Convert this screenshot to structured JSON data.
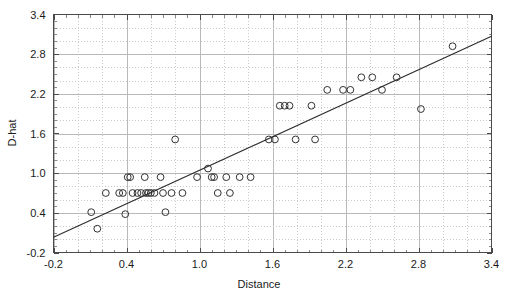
{
  "chart_data": {
    "type": "scatter",
    "title": "",
    "xlabel": "Distance",
    "ylabel": "D-hat",
    "xlim": [
      -0.2,
      3.4
    ],
    "ylim": [
      -0.2,
      3.4
    ],
    "xticks": [
      "-0.2",
      "0.4",
      "1.0",
      "1.6",
      "2.2",
      "2.8",
      "3.4"
    ],
    "yticks": [
      "-0.2",
      "0.4",
      "1.0",
      "1.6",
      "2.2",
      "2.8",
      "3.4"
    ],
    "xtick_values": [
      -0.2,
      0.4,
      1.0,
      1.6,
      2.2,
      2.8,
      3.4
    ],
    "ytick_values": [
      -0.2,
      0.4,
      1.0,
      1.6,
      2.2,
      2.8,
      3.4
    ],
    "grid": true,
    "legend": false,
    "marker": "open-circle",
    "series": [
      {
        "name": "observations",
        "points": [
          [
            0.11,
            0.41
          ],
          [
            0.16,
            0.16
          ],
          [
            0.23,
            0.7
          ],
          [
            0.34,
            0.7
          ],
          [
            0.37,
            0.7
          ],
          [
            0.39,
            0.38
          ],
          [
            0.41,
            0.94
          ],
          [
            0.43,
            0.94
          ],
          [
            0.45,
            0.7
          ],
          [
            0.49,
            0.7
          ],
          [
            0.52,
            0.7
          ],
          [
            0.55,
            0.94
          ],
          [
            0.56,
            0.7
          ],
          [
            0.58,
            0.7
          ],
          [
            0.6,
            0.7
          ],
          [
            0.63,
            0.7
          ],
          [
            0.68,
            0.94
          ],
          [
            0.7,
            0.7
          ],
          [
            0.72,
            0.41
          ],
          [
            0.77,
            0.7
          ],
          [
            0.8,
            1.51
          ],
          [
            0.86,
            0.7
          ],
          [
            0.98,
            0.94
          ],
          [
            1.07,
            1.07
          ],
          [
            1.1,
            0.94
          ],
          [
            1.12,
            0.94
          ],
          [
            1.15,
            0.7
          ],
          [
            1.22,
            0.94
          ],
          [
            1.25,
            0.7
          ],
          [
            1.33,
            0.94
          ],
          [
            1.42,
            0.94
          ],
          [
            1.57,
            1.51
          ],
          [
            1.62,
            1.51
          ],
          [
            1.66,
            2.02
          ],
          [
            1.7,
            2.02
          ],
          [
            1.74,
            2.02
          ],
          [
            1.79,
            1.51
          ],
          [
            1.92,
            2.02
          ],
          [
            1.95,
            1.51
          ],
          [
            2.05,
            2.26
          ],
          [
            2.18,
            2.26
          ],
          [
            2.24,
            2.26
          ],
          [
            2.33,
            2.45
          ],
          [
            2.42,
            2.45
          ],
          [
            2.5,
            2.26
          ],
          [
            2.62,
            2.45
          ],
          [
            2.82,
            1.97
          ],
          [
            3.08,
            2.92
          ]
        ]
      }
    ],
    "fit_line": {
      "name": "least-squares fit",
      "x_start": -0.2,
      "y_start": 0.03,
      "x_end": 3.4,
      "y_end": 3.07,
      "slope": 0.845,
      "intercept": 0.199
    }
  }
}
